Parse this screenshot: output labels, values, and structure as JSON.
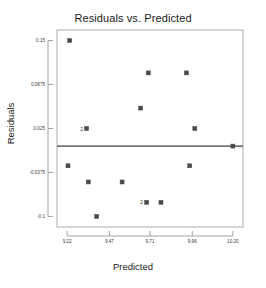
{
  "chart_data": {
    "type": "scatter",
    "title": "Residuals vs. Predicted",
    "xlabel": "Predicted",
    "ylabel": "Residuals",
    "xlim": [
      9.16,
      10.26
    ],
    "ylim": [
      -0.115,
      0.165
    ],
    "xticks": [
      "9.22",
      "9.47",
      "9.71",
      "9.96",
      "10.20"
    ],
    "xtick_values": [
      9.22,
      9.47,
      9.71,
      9.96,
      10.2
    ],
    "yticks": [
      "0.15",
      "0.0875",
      "0.025",
      "-0.0375",
      "-0.1"
    ],
    "ytick_values": [
      0.15,
      0.0875,
      0.025,
      -0.0375,
      -0.1
    ],
    "grid": false,
    "legend": "none",
    "reference_line": {
      "orientation": "horizontal",
      "y": 0.0,
      "color": "#111111"
    },
    "marker": {
      "shape": "square",
      "color": "#4a4a4a",
      "size": 4
    },
    "points": [
      {
        "x": 9.235,
        "y": 0.15,
        "count": 1,
        "label": ""
      },
      {
        "x": 9.225,
        "y": -0.028,
        "count": 1,
        "label": ""
      },
      {
        "x": 9.335,
        "y": 0.025,
        "count": 2,
        "label": "2"
      },
      {
        "x": 9.345,
        "y": -0.051,
        "count": 1,
        "label": ""
      },
      {
        "x": 9.395,
        "y": -0.1,
        "count": 1,
        "label": ""
      },
      {
        "x": 9.545,
        "y": -0.051,
        "count": 1,
        "label": ""
      },
      {
        "x": 9.655,
        "y": 0.054,
        "count": 1,
        "label": ""
      },
      {
        "x": 9.7,
        "y": 0.104,
        "count": 1,
        "label": ""
      },
      {
        "x": 9.69,
        "y": -0.08,
        "count": 2,
        "label": "2"
      },
      {
        "x": 9.775,
        "y": -0.08,
        "count": 1,
        "label": ""
      },
      {
        "x": 9.925,
        "y": 0.104,
        "count": 1,
        "label": ""
      },
      {
        "x": 9.945,
        "y": -0.028,
        "count": 1,
        "label": ""
      },
      {
        "x": 9.975,
        "y": 0.025,
        "count": 1,
        "label": ""
      },
      {
        "x": 10.2,
        "y": 0.0,
        "count": 1,
        "label": ""
      }
    ]
  },
  "frame": {
    "border_color": "#9a9a9a",
    "axis_color": "#8a8a8a",
    "background": "#ffffff"
  }
}
